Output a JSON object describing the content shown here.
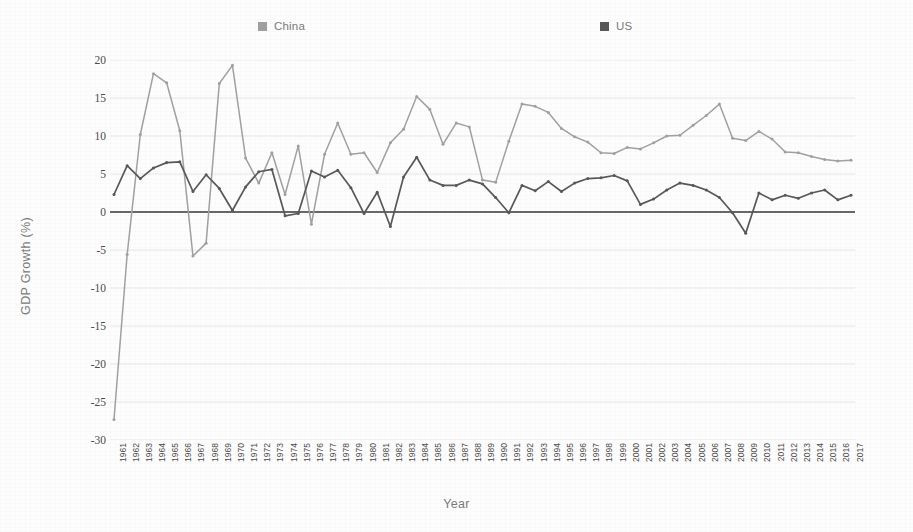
{
  "axis_titles": {
    "x": "Year",
    "y": "GDP Growth (%)"
  },
  "legend": {
    "position": "top",
    "items": [
      {
        "label": "China",
        "color": "#a0a0a0",
        "swatch_name": "legend-swatch-china"
      },
      {
        "label": "US",
        "color": "#585858",
        "swatch_name": "legend-swatch-us"
      }
    ]
  },
  "chart_data": {
    "type": "line",
    "title": "",
    "xlabel": "Year",
    "ylabel": "GDP Growth (%)",
    "ylim": [
      -30,
      20
    ],
    "ytick_values": [
      20,
      15,
      10,
      5,
      0,
      -5,
      -10,
      -15,
      -20,
      -25,
      -30
    ],
    "grid": true,
    "zero_line": true,
    "legend_position": "top",
    "categories": [
      "1961",
      "1962",
      "1963",
      "1964",
      "1965",
      "1966",
      "1967",
      "1968",
      "1969",
      "1970",
      "1971",
      "1972",
      "1973",
      "1974",
      "1975",
      "1976",
      "1977",
      "1978",
      "1979",
      "1980",
      "1981",
      "1982",
      "1983",
      "1984",
      "1985",
      "1986",
      "1987",
      "1988",
      "1989",
      "1990",
      "1991",
      "1992",
      "1993",
      "1994",
      "1995",
      "1996",
      "1997",
      "1998",
      "1999",
      "2000",
      "2001",
      "2002",
      "2003",
      "2004",
      "2005",
      "2006",
      "2007",
      "2008",
      "2009",
      "2010",
      "2011",
      "2012",
      "2013",
      "2014",
      "2015",
      "2016",
      "2017"
    ],
    "series": [
      {
        "name": "China",
        "color": "#a0a0a0",
        "values": [
          -27.3,
          -5.6,
          10.2,
          18.2,
          17.0,
          10.7,
          -5.8,
          -4.1,
          16.9,
          19.3,
          7.1,
          3.8,
          7.8,
          2.3,
          8.7,
          -1.6,
          7.6,
          11.7,
          7.6,
          7.8,
          5.2,
          9.1,
          10.9,
          15.2,
          13.5,
          8.9,
          11.7,
          11.2,
          4.2,
          3.9,
          9.3,
          14.2,
          13.9,
          13.1,
          11.0,
          9.9,
          9.2,
          7.8,
          7.7,
          8.5,
          8.3,
          9.1,
          10.0,
          10.1,
          11.4,
          12.7,
          14.2,
          9.7,
          9.4,
          10.6,
          9.6,
          7.9,
          7.8,
          7.3,
          6.9,
          6.7,
          6.8
        ]
      },
      {
        "name": "US",
        "color": "#585858",
        "values": [
          2.3,
          6.1,
          4.4,
          5.8,
          6.5,
          6.6,
          2.7,
          4.9,
          3.1,
          0.2,
          3.3,
          5.3,
          5.6,
          -0.5,
          -0.2,
          5.4,
          4.6,
          5.5,
          3.2,
          -0.2,
          2.6,
          -1.9,
          4.6,
          7.2,
          4.2,
          3.5,
          3.5,
          4.2,
          3.7,
          1.9,
          -0.1,
          3.5,
          2.8,
          4.0,
          2.7,
          3.8,
          4.4,
          4.5,
          4.8,
          4.1,
          1.0,
          1.7,
          2.9,
          3.8,
          3.5,
          2.9,
          1.9,
          -0.1,
          -2.8,
          2.5,
          1.6,
          2.2,
          1.8,
          2.5,
          2.9,
          1.6,
          2.2
        ]
      }
    ]
  }
}
